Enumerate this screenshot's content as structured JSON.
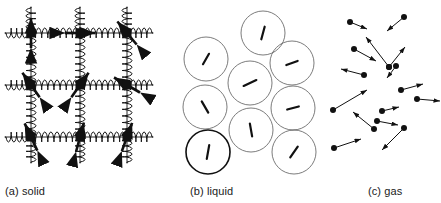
{
  "figure": {
    "width": 441,
    "height": 203,
    "background": "#ffffff",
    "ink": "#111111",
    "liquid_stroke": "#5a5a5a",
    "liquid_stroke_emphasis": "#111111"
  },
  "panels": [
    {
      "id": "solid",
      "caption": "(a) solid",
      "caption_x": 5,
      "caption_y": 185
    },
    {
      "id": "liquid",
      "caption": "(b) liquid",
      "caption_x": 190,
      "caption_y": 185
    },
    {
      "id": "gas",
      "caption": "(c) gas",
      "caption_x": 368,
      "caption_y": 185
    }
  ],
  "solid": {
    "node_x": [
      31,
      80,
      127
    ],
    "node_y": [
      33,
      85,
      137
    ],
    "node_size": 9,
    "spring_overhang": 26,
    "spring_coils": 7,
    "spring_amplitude": 5,
    "arrow_length": 15,
    "arrows": [
      {
        "row": 0,
        "col": 0,
        "angle": 90
      },
      {
        "row": 0,
        "col": 1,
        "angle": 0
      },
      {
        "row": 0,
        "col": 2,
        "angle": 130
      },
      {
        "row": 1,
        "col": 0,
        "angle": 125
      },
      {
        "row": 1,
        "col": 1,
        "angle": 55
      },
      {
        "row": 1,
        "col": 2,
        "angle": 150
      },
      {
        "row": 2,
        "col": 0,
        "angle": 115
      },
      {
        "row": 2,
        "col": 1,
        "angle": 75
      },
      {
        "row": 2,
        "col": 2,
        "angle": 70
      }
    ]
  },
  "liquid": {
    "radius": 22,
    "circles": [
      {
        "cx": 263,
        "cy": 33,
        "emphasis": false,
        "angle": 75,
        "len": 13
      },
      {
        "cx": 206,
        "cy": 59,
        "emphasis": false,
        "angle": 60,
        "len": 12
      },
      {
        "cx": 292,
        "cy": 63,
        "emphasis": false,
        "angle": 20,
        "len": 12
      },
      {
        "cx": 250,
        "cy": 83,
        "emphasis": false,
        "angle": 25,
        "len": 14
      },
      {
        "cx": 205,
        "cy": 107,
        "emphasis": false,
        "angle": 120,
        "len": 13
      },
      {
        "cx": 293,
        "cy": 108,
        "emphasis": false,
        "angle": 15,
        "len": 12
      },
      {
        "cx": 251,
        "cy": 130,
        "emphasis": false,
        "angle": 100,
        "len": 13
      },
      {
        "cx": 208,
        "cy": 152,
        "emphasis": true,
        "angle": 80,
        "len": 14
      },
      {
        "cx": 294,
        "cy": 152,
        "emphasis": false,
        "angle": 55,
        "len": 13
      }
    ]
  },
  "gas": {
    "dot_radius": 3,
    "particles": [
      {
        "x": 350,
        "y": 22,
        "dx": 17,
        "dy": 7
      },
      {
        "x": 404,
        "y": 17,
        "dx": -17,
        "dy": 14
      },
      {
        "x": 396,
        "y": 66,
        "dx": -9,
        "dy": 12
      },
      {
        "x": 401,
        "y": 90,
        "dx": 22,
        "dy": -6
      },
      {
        "x": 417,
        "y": 99,
        "dx": 23,
        "dy": 2
      },
      {
        "x": 354,
        "y": 49,
        "dx": 22,
        "dy": 12
      },
      {
        "x": 389,
        "y": 67,
        "dx": -23,
        "dy": -30
      },
      {
        "x": 389,
        "y": 67,
        "dx": 16,
        "dy": -20
      },
      {
        "x": 364,
        "y": 75,
        "dx": -23,
        "dy": -6
      },
      {
        "x": 382,
        "y": 111,
        "dx": 17,
        "dy": -4
      },
      {
        "x": 333,
        "y": 110,
        "dx": 34,
        "dy": -20
      },
      {
        "x": 377,
        "y": 121,
        "dx": 21,
        "dy": 4
      },
      {
        "x": 374,
        "y": 129,
        "dx": -21,
        "dy": -17
      },
      {
        "x": 334,
        "y": 148,
        "dx": 27,
        "dy": -9
      },
      {
        "x": 404,
        "y": 128,
        "dx": -22,
        "dy": 22
      }
    ]
  }
}
